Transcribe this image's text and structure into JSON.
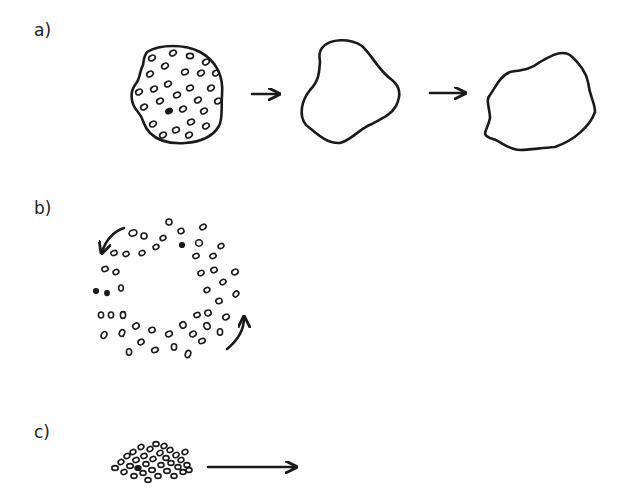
{
  "panels": [
    {
      "label": "a)",
      "description": "cell aggregate loses internal cells; outline changes shape over time",
      "stages": [
        "aggregate-with-cells",
        "empty-outline",
        "empty-outline-reshaped"
      ],
      "arrows": 2
    },
    {
      "label": "b)",
      "description": "ring of cells rotating",
      "rotation_arrows": [
        "counterclockwise-top-left",
        "counterclockwise-bottom-right"
      ]
    },
    {
      "label": "c)",
      "description": "dense cluster of cells migrating to the right",
      "arrows": 1
    }
  ],
  "colors": {
    "ink": "#1a1a1a",
    "background": "#ffffff"
  }
}
